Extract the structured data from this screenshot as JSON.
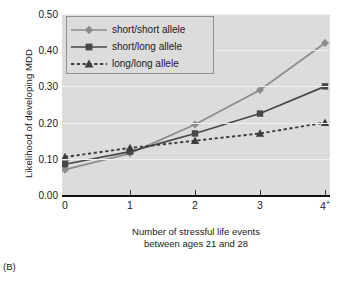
{
  "caption": "(B)",
  "chart_data": {
    "type": "line",
    "title": "",
    "xlabel": "Number of stressful life events between ages 21 and 28",
    "xlabel_line1": "Number of stressful life events",
    "xlabel_line2": "between ages 21 and 28",
    "ylabel": "Likelihood of developing MDD",
    "categories": [
      "0",
      "1",
      "2",
      "3",
      "4+"
    ],
    "x_tick_labels": [
      "0",
      "1",
      "2",
      "3",
      "4"
    ],
    "x_tick_superscripts": [
      "",
      "",
      "",
      "",
      "+"
    ],
    "y_tick_labels": [
      "0.00",
      "0.10",
      "0.20",
      "0.30",
      "0.40",
      "0.50"
    ],
    "y_tick_values": [
      0.0,
      0.1,
      0.2,
      0.3,
      0.4,
      0.5
    ],
    "ylim": [
      0.0,
      0.5
    ],
    "grid": true,
    "legend_position": "upper-left-inside",
    "series": [
      {
        "name": "short/short allele",
        "values": [
          0.07,
          0.115,
          0.195,
          0.29,
          0.42
        ],
        "marker": "diamond",
        "color": "#8c8c8c",
        "linestyle": "solid"
      },
      {
        "name": "short/long allele",
        "values": [
          0.085,
          0.12,
          0.17,
          0.225,
          0.3
        ],
        "marker": "square",
        "color": "#474747",
        "linestyle": "solid"
      },
      {
        "name": "long/long allele",
        "values": [
          0.105,
          0.13,
          0.15,
          0.17,
          0.2
        ],
        "marker": "triangle",
        "color": "#3d3d3d",
        "linestyle": "dashed"
      }
    ]
  },
  "colors": {
    "panel_background": "#dcdcdc",
    "gridline": "#f0f0f0",
    "axis": "#111111",
    "legend_border": "#8e8e8e"
  }
}
